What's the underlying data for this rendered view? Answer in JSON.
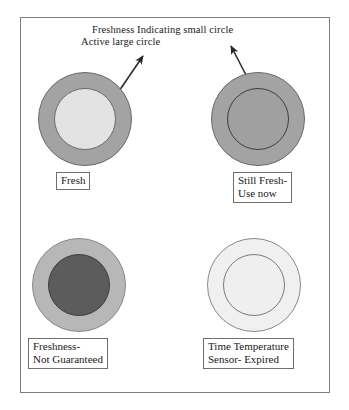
{
  "figure": {
    "annotation": {
      "line1": "Freshness Indicating small circle",
      "line2": "Active large circle"
    },
    "cells": [
      {
        "id": "top-left",
        "state": "fresh",
        "caption_lines": [
          "Fresh"
        ],
        "outer_color": "#a3a3a3",
        "outer_stroke": "#6b6b6b",
        "inner_color": "#e3e3e3",
        "inner_stroke": "#6b6b6b"
      },
      {
        "id": "top-right",
        "state": "still-fresh",
        "caption_lines": [
          "Still Fresh-",
          "Use now"
        ],
        "outer_color": "#a3a3a3",
        "outer_stroke": "#6b6b6b",
        "inner_color": "#a0a0a0",
        "inner_stroke": "#3d3d3d"
      },
      {
        "id": "bottom-left",
        "state": "not-guaranteed",
        "caption_lines": [
          "Freshness-",
          "Not Guaranteed"
        ],
        "outer_color": "#b7b7b7",
        "outer_stroke": "#8a8a8a",
        "inner_color": "#5c5c5c",
        "inner_stroke": "#3d3d3d"
      },
      {
        "id": "bottom-right",
        "state": "expired",
        "caption_lines": [
          "Time Temperature",
          "Sensor- Expired"
        ],
        "outer_color": "#f0f0f0",
        "outer_stroke": "#8a8a8a",
        "inner_color": "#efefef",
        "inner_stroke": "#7a7a7a"
      }
    ],
    "arrows": [
      {
        "id": "arrow-active-large-circle",
        "points_to": "outer-ring-of-fresh-sensor"
      },
      {
        "id": "arrow-freshness-small-circle",
        "points_to": "inner-circle-of-still-fresh-sensor"
      }
    ],
    "colors": {
      "frame_stroke": "#7d7d7d",
      "arrow": "#262626",
      "text": "#1a1a1a",
      "background": "#ffffff"
    }
  }
}
